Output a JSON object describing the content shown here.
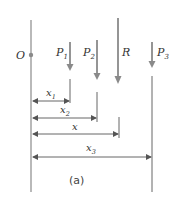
{
  "diagram": {
    "caption": "(a)",
    "origin_label": "O",
    "forces": [
      {
        "name": "P",
        "sub": "1",
        "x": 70
      },
      {
        "name": "P",
        "sub": "2",
        "x": 97
      },
      {
        "name": "R",
        "sub": "",
        "x": 118
      },
      {
        "name": "P",
        "sub": "3",
        "x": 152
      }
    ],
    "dimensions": [
      {
        "name": "x",
        "sub": "1",
        "y": 101,
        "to": 70
      },
      {
        "name": "x",
        "sub": "2",
        "y": 118,
        "to": 97
      },
      {
        "name": "x",
        "sub": "",
        "y": 134,
        "to": 119
      },
      {
        "name": "x",
        "sub": "3",
        "y": 157,
        "to": 151
      }
    ],
    "colors": {
      "force_arrow": "#8a8a8a",
      "line": "#555555",
      "text": "#333333"
    }
  }
}
